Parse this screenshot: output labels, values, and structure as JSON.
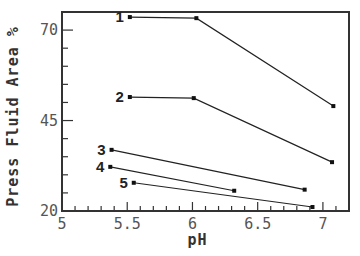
{
  "chart_data": {
    "type": "line",
    "title": "",
    "xlabel": "pH",
    "ylabel": "Press Fluid Area %",
    "xlim": [
      5,
      7.2
    ],
    "ylim": [
      20,
      75
    ],
    "xticks": [
      5,
      5.5,
      6,
      6.5,
      7
    ],
    "xtick_labels": [
      "5",
      "5.5",
      "6",
      "6.5",
      "7"
    ],
    "x_minor_step": 0.1,
    "yticks": [
      20,
      45,
      70
    ],
    "ytick_labels": [
      "20",
      "45",
      "70"
    ],
    "y_minor_step": 5,
    "grid": false,
    "legend": "inline labels at line starts",
    "series": [
      {
        "name": "1",
        "x": [
          5.52,
          6.03,
          7.08
        ],
        "y": [
          73.6,
          73.3,
          49.0
        ]
      },
      {
        "name": "2",
        "x": [
          5.52,
          6.01,
          7.07
        ],
        "y": [
          51.5,
          51.2,
          33.5
        ]
      },
      {
        "name": "3",
        "x": [
          5.38,
          6.86
        ],
        "y": [
          36.9,
          25.9
        ]
      },
      {
        "name": "4",
        "x": [
          5.37,
          6.32
        ],
        "y": [
          32.2,
          25.6
        ]
      },
      {
        "name": "5",
        "x": [
          5.55,
          6.92
        ],
        "y": [
          27.8,
          21.1
        ]
      }
    ]
  }
}
